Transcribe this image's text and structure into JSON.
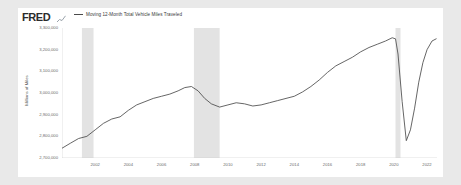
{
  "widget": {
    "brand": "FRED",
    "brand_mark_icon": "mini-line-chart-icon"
  },
  "legend": {
    "position": "top-left",
    "entries": [
      {
        "label": "Moving 12-Month Total Vehicle Miles Traveled",
        "color": "#4a4a4a"
      }
    ]
  },
  "colors": {
    "line": "#4a4a4a",
    "recession_band": "#e3e3e3",
    "panel_background": "#ffffff",
    "page_background": "#e9e9e9",
    "axis_text": "#6a6a6a"
  },
  "chart_data": {
    "type": "line",
    "title": "",
    "xlabel": "",
    "ylabel": "Millions of Miles",
    "xlim": [
      2000.0,
      2022.6
    ],
    "ylim": [
      2700000,
      3300000
    ],
    "grid": false,
    "legend_position": "top-left",
    "y_ticks": [
      "3,300,000",
      "3,200,000",
      "3,100,000",
      "3,000,000",
      "2,900,000",
      "2,800,000",
      "2,700,000"
    ],
    "y_tick_values": [
      3300000,
      3200000,
      3100000,
      3000000,
      2900000,
      2800000,
      2700000
    ],
    "x_ticks": [
      "2002",
      "2004",
      "2006",
      "2008",
      "2010",
      "2012",
      "2014",
      "2016",
      "2018",
      "2020",
      "2022"
    ],
    "x_tick_values": [
      2002,
      2004,
      2006,
      2008,
      2010,
      2012,
      2014,
      2016,
      2018,
      2020,
      2022
    ],
    "recession_bands": [
      {
        "start": 2001.2,
        "end": 2001.9
      },
      {
        "start": 2007.95,
        "end": 2009.5
      },
      {
        "start": 2020.1,
        "end": 2020.4
      }
    ],
    "series": [
      {
        "name": "Moving 12-Month Total Vehicle Miles Traveled",
        "units": "Millions of Miles",
        "color": "#4a4a4a",
        "x": [
          2000.0,
          2000.5,
          2001.0,
          2001.5,
          2002.0,
          2002.5,
          2003.0,
          2003.5,
          2004.0,
          2004.5,
          2005.0,
          2005.5,
          2006.0,
          2006.5,
          2007.0,
          2007.4,
          2007.8,
          2008.2,
          2008.6,
          2009.0,
          2009.5,
          2010.0,
          2010.5,
          2011.0,
          2011.5,
          2012.0,
          2012.5,
          2013.0,
          2013.5,
          2014.0,
          2014.5,
          2015.0,
          2015.5,
          2016.0,
          2016.5,
          2017.0,
          2017.5,
          2018.0,
          2018.5,
          2019.0,
          2019.5,
          2019.9,
          2020.1,
          2020.25,
          2020.5,
          2020.75,
          2021.0,
          2021.25,
          2021.5,
          2021.75,
          2022.0,
          2022.3,
          2022.55
        ],
        "values": [
          2745000,
          2768000,
          2790000,
          2800000,
          2830000,
          2860000,
          2880000,
          2890000,
          2920000,
          2945000,
          2960000,
          2975000,
          2985000,
          2995000,
          3010000,
          3025000,
          3030000,
          3010000,
          2975000,
          2950000,
          2935000,
          2945000,
          2955000,
          2950000,
          2940000,
          2945000,
          2955000,
          2965000,
          2975000,
          2985000,
          3005000,
          3030000,
          3060000,
          3095000,
          3125000,
          3145000,
          3165000,
          3190000,
          3210000,
          3225000,
          3240000,
          3255000,
          3250000,
          3180000,
          2960000,
          2780000,
          2830000,
          2930000,
          3050000,
          3140000,
          3200000,
          3240000,
          3250000
        ]
      }
    ]
  }
}
